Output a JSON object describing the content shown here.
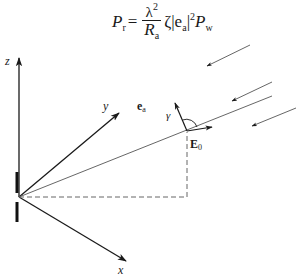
{
  "formula": {
    "lhs": "P",
    "lhs_sub": "r",
    "equals": "=",
    "numerator": "λ",
    "numerator_sup": "2",
    "denominator": "R",
    "denominator_sub": "a",
    "zeta": "ζ",
    "abs_open": "|e",
    "abs_sub": "a",
    "abs_close": "|",
    "abs_sup": "2",
    "rhs": "P",
    "rhs_sub": "w"
  },
  "labels": {
    "z_axis": "z",
    "y_axis": "y",
    "x_axis": "x",
    "ea_main": "e",
    "ea_sub": "a",
    "e0_main": "E",
    "e0_sub": "0",
    "gamma": "γ"
  },
  "colors": {
    "stroke": "#1a1a1a",
    "dashed": "#666666",
    "thin_line": "#555555"
  }
}
